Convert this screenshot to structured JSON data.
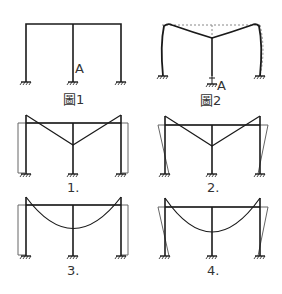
{
  "figure1": {
    "caption": "圖1",
    "point_label": "A"
  },
  "figure2": {
    "caption": "圖2",
    "point_label": "A"
  },
  "options": [
    {
      "label": "1."
    },
    {
      "label": "2."
    },
    {
      "label": "3."
    },
    {
      "label": "4."
    }
  ],
  "colors": {
    "line": "#1a1a1a",
    "thin": "#555555",
    "dashed": "#888888"
  }
}
